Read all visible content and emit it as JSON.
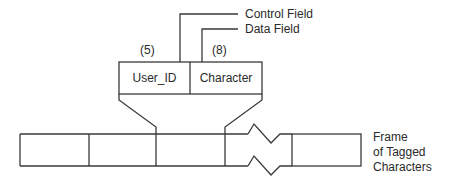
{
  "diagram": {
    "annotations": {
      "control_field": "Control Field",
      "data_field": "Data Field"
    },
    "tag_box": {
      "fields": [
        {
          "label": "User_ID",
          "size": "(5)"
        },
        {
          "label": "Character",
          "size": "(8)"
        }
      ]
    },
    "frame": {
      "label_lines": [
        "Frame",
        "of Tagged",
        "Characters"
      ],
      "cell_count_visible": 5,
      "break_symbol": "zigzag"
    },
    "colors": {
      "line": "#3a3a3a",
      "text": "#2a2a2a",
      "background": "#ffffff"
    }
  }
}
